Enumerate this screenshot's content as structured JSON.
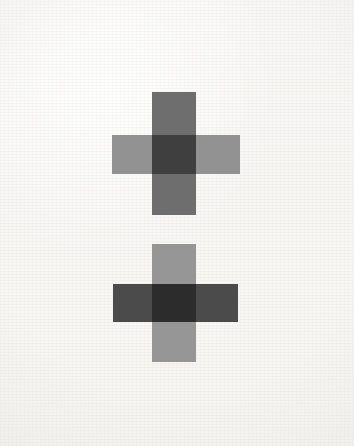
{
  "artwork": {
    "title": "Two Crosses",
    "canvas": {
      "width": 354,
      "height": 446,
      "background_color": "#f7f6f4",
      "texture": "paper-grain",
      "medium": "flat-opaque-paint-on-paper"
    },
    "composition": {
      "shape_count": 2,
      "arrangement": "vertically-stacked-centered",
      "blend_mode": "multiply",
      "description": "Two plus-sign crosses stacked vertically on an off-white textured ground; each cross is formed by one vertical bar and one horizontal bar of differing gray values that darken where they overlap."
    },
    "shapes": [
      {
        "name": "upper-cross",
        "center_x": 176,
        "center_y": 153,
        "vertical_bar": {
          "x": 152,
          "y": 92,
          "width": 44,
          "height": 123,
          "color": "#6e6e6e",
          "value": "medium-dark-gray"
        },
        "horizontal_bar": {
          "x": 112,
          "y": 135,
          "width": 128,
          "height": 39,
          "color": "#929292",
          "value": "light-gray"
        },
        "intersection": {
          "x": 152,
          "y": 135,
          "width": 44,
          "height": 39,
          "color": "#2b2b2b",
          "value": "near-black"
        },
        "contrast_note": "dark vertical over light horizontal"
      },
      {
        "name": "lower-cross",
        "center_x": 176,
        "center_y": 303,
        "vertical_bar": {
          "x": 152,
          "y": 244,
          "width": 44,
          "height": 118,
          "color": "#969696",
          "value": "light-gray"
        },
        "horizontal_bar": {
          "x": 113,
          "y": 284,
          "width": 125,
          "height": 38,
          "color": "#4b4b4b",
          "value": "dark-gray"
        },
        "intersection": {
          "x": 152,
          "y": 284,
          "width": 44,
          "height": 38,
          "color": "#252525",
          "value": "near-black"
        },
        "contrast_note": "light vertical over dark horizontal"
      }
    ],
    "palette": {
      "background": "#f7f6f4",
      "light_gray": "#939393",
      "medium_gray": "#6e6e6e",
      "dark_gray": "#4b4b4b",
      "near_black": "#282828"
    }
  }
}
